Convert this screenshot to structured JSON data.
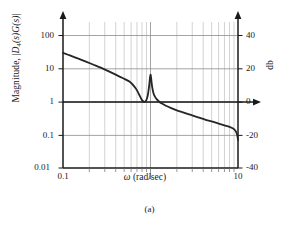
{
  "figure": {
    "caption": "(a)"
  },
  "chart_data": {
    "type": "line",
    "title": "",
    "subtitle": "",
    "xlabel": "ω (rad/sec)",
    "ylabel": "Magnitude, |D4(s)G(s)|",
    "ylabel_right": "db",
    "xscale": "log",
    "yscale": "log",
    "xlim": [
      0.1,
      10
    ],
    "ylim": [
      0.01,
      200
    ],
    "grid": true,
    "grid_style": "log-minor-vertical-and-major-horizontal",
    "legend": null,
    "legend_position": "none",
    "xticks": [
      "0.1",
      "1",
      "10"
    ],
    "xtick_values": [
      0.1,
      1,
      10
    ],
    "yticks_left": [
      "0.01",
      "0.1",
      "1",
      "10",
      "100"
    ],
    "ytick_left_values": [
      0.01,
      0.1,
      1,
      10,
      100
    ],
    "yticks_right": [
      "-40",
      "-20",
      "0",
      "20",
      "40"
    ],
    "ytick_right_values": [
      -40,
      -20,
      0,
      20,
      40
    ],
    "right_axis_unit": "db",
    "annotations": [
      {
        "name": "zero-db-arrow",
        "description": "horizontal arrow at magnitude 1 / 0 db extending right past axis"
      },
      {
        "name": "left-axis-arrow",
        "description": "upward arrow at top of left magnitude axis"
      },
      {
        "name": "right-axis-arrow",
        "description": "upward arrow at top of right db axis"
      }
    ],
    "series": [
      {
        "name": "|D4(s)G(s)|",
        "color": "#262626",
        "linewidth": 1.8,
        "x": [
          0.1,
          0.12,
          0.15,
          0.18,
          0.22,
          0.27,
          0.33,
          0.4,
          0.48,
          0.58,
          0.68,
          0.75,
          0.8,
          0.84,
          0.87,
          0.9,
          0.93,
          0.95,
          0.97,
          0.985,
          1.0,
          1.015,
          1.03,
          1.05,
          1.08,
          1.12,
          1.17,
          1.25,
          1.35,
          1.5,
          1.7,
          2.0,
          2.4,
          2.9,
          3.5,
          4.2,
          5.0,
          6.0,
          7.0,
          8.0,
          8.8,
          9.3,
          9.65,
          9.85,
          10.0
        ],
        "y": [
          30.0,
          25.0,
          20.0,
          16.5,
          13.3,
          10.7,
          8.4,
          6.6,
          5.2,
          4.0,
          2.5,
          1.55,
          1.12,
          1.0,
          1.02,
          1.15,
          1.55,
          2.2,
          3.4,
          5.2,
          6.6,
          5.4,
          3.8,
          2.6,
          1.85,
          1.45,
          1.22,
          1.02,
          0.88,
          0.76,
          0.65,
          0.55,
          0.47,
          0.4,
          0.34,
          0.29,
          0.255,
          0.22,
          0.195,
          0.175,
          0.155,
          0.135,
          0.112,
          0.09,
          0.07
        ],
        "peak": {
          "x": 1.0,
          "y": 6.6,
          "db": 16.4
        },
        "description": "resonant peak at omega = 1 rad/sec, rolling off at high frequency"
      }
    ]
  }
}
